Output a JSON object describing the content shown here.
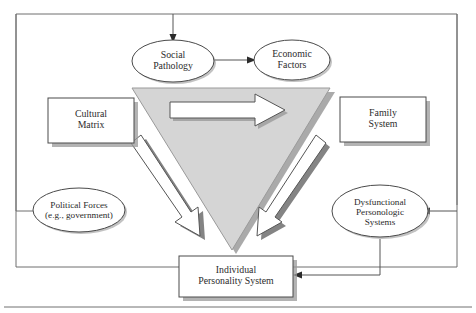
{
  "figure": {
    "type": "diagram"
  },
  "palette": {
    "frame_stroke": "#6e6e6e",
    "node_stroke": "#4a4a4a",
    "text": "#2b2b2b",
    "triangle_fill": "#d5d5d5",
    "triangle_stroke": "#8c8c8c",
    "shadow": "#8e8e8e",
    "arrow_fill": "#ffffff",
    "arrow_stroke": "#555555",
    "connector": "#555555",
    "rule": "#707070"
  },
  "nodes": {
    "social_pathology": {
      "label": "Social\nPathology",
      "shape": "ellipse"
    },
    "economic_factors": {
      "label": "Economic\nFactors",
      "shape": "ellipse"
    },
    "cultural_matrix": {
      "label": "Cultural\nMatrix",
      "shape": "rect"
    },
    "family_system": {
      "label": "Family\nSystem",
      "shape": "rect"
    },
    "political_forces": {
      "label": "Political Forces\n(e.g., government)",
      "shape": "ellipse"
    },
    "dysfunctional_personologic": {
      "label": "Dysfunctional\nPersonologic\nSystems",
      "shape": "ellipse"
    },
    "individual_personality": {
      "label": "Individual\nPersonality System",
      "shape": "rect"
    },
    "central_triangle": {
      "label": "",
      "shape": "inverted-triangle"
    }
  },
  "connectors": [
    {
      "name": "social-pathology-to-economic-factors",
      "from": "social_pathology",
      "to": "economic_factors",
      "style": "straight-arrow"
    },
    {
      "name": "feedback-loop-into-social-pathology",
      "from": "political_forces",
      "to": "social_pathology",
      "style": "orthogonal-arrow"
    },
    {
      "name": "right-loop-into-dysfunctional",
      "from": "frame-right",
      "to": "dysfunctional_personologic",
      "style": "orthogonal-arrow"
    },
    {
      "name": "dysfunctional-to-individual-personality",
      "from": "dysfunctional_personologic",
      "to": "individual_personality",
      "style": "orthogonal-arrow"
    },
    {
      "name": "triangle-top-rightward-arrow",
      "from": "cultural_matrix",
      "to": "family_system",
      "style": "block-arrow"
    },
    {
      "name": "left-diagonal-block-arrow",
      "from": "cultural_matrix",
      "to": "individual_personality",
      "style": "block-arrow"
    },
    {
      "name": "right-diagonal-block-arrow",
      "from": "family_system",
      "to": "individual_personality",
      "style": "block-arrow"
    }
  ]
}
